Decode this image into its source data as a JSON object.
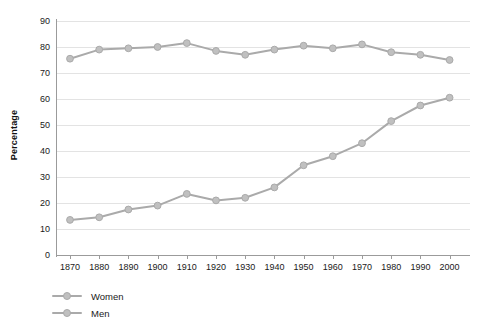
{
  "chart_data": {
    "type": "line",
    "title": "",
    "xlabel": "",
    "ylabel": "Percentage",
    "ylim": [
      0,
      90
    ],
    "y_ticks": [
      0,
      10,
      20,
      30,
      40,
      50,
      60,
      70,
      80,
      90
    ],
    "grid": true,
    "legend_position": "bottom-left",
    "categories": [
      1870,
      1880,
      1890,
      1900,
      1910,
      1920,
      1930,
      1940,
      1950,
      1960,
      1970,
      1980,
      1990,
      2000
    ],
    "x_tick_labels": [
      "1870",
      "1880",
      "1890",
      "1900",
      "1910",
      "1920",
      "1930",
      "1940",
      "1950",
      "1960",
      "1970",
      "1980",
      "1990",
      "2000"
    ],
    "series": [
      {
        "name": "Women",
        "color": "#aaaaaa",
        "marker_color": "#c0c0c0",
        "values": [
          13.5,
          14.5,
          17.5,
          19,
          23.5,
          21,
          22,
          26,
          34.5,
          38,
          43,
          51.5,
          57.5,
          60.5
        ]
      },
      {
        "name": "Men",
        "color": "#aaaaaa",
        "marker_color": "#c0c0c0",
        "values": [
          75.5,
          79,
          79.5,
          80,
          81.5,
          78.5,
          77,
          79,
          80.5,
          79.5,
          81,
          78,
          77,
          75
        ]
      }
    ]
  },
  "legend": {
    "items": [
      {
        "label": "Women"
      },
      {
        "label": "Men"
      }
    ]
  },
  "colors": {
    "series": "#aaaaaa",
    "marker": "#c2c2c2",
    "gridline": "#e3e3e3",
    "axis": "#9b9b9b",
    "text": "#1a1a1a",
    "background": "#ffffff"
  }
}
